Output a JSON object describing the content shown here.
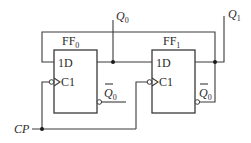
{
  "diagram": {
    "type": "sequential-logic-circuit",
    "flipflops": [
      {
        "name": "FF",
        "index": "0",
        "d_label": "1D",
        "clk_label": "C1",
        "q_label": "Q",
        "q_sub": "0",
        "qbar_label": "Q",
        "qbar_sub": "0"
      },
      {
        "name": "FF",
        "index": "1",
        "d_label": "1D",
        "clk_label": "C1",
        "q_label": "Q",
        "q_sub": "1",
        "qbar_label": "Q",
        "qbar_sub": "0"
      }
    ],
    "clock_label": "CP",
    "colors": {
      "line": "#3a3a3a",
      "background": "#ffffff"
    }
  }
}
